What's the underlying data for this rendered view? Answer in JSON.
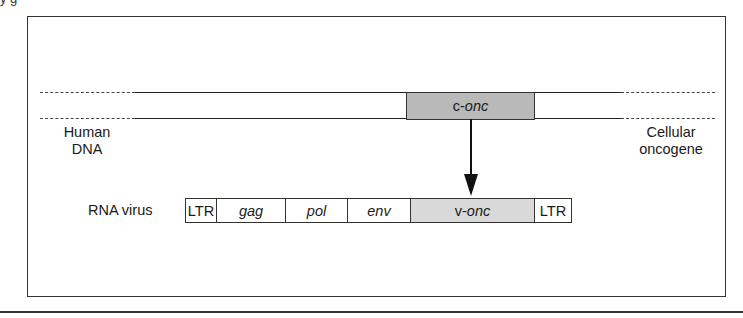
{
  "diagram": {
    "caption_fragment": "y g",
    "dna": {
      "left_label_line1": "Human",
      "left_label_line2": "DNA",
      "right_label_line1": "Cellular",
      "right_label_line2": "oncogene",
      "gene_prefix": "c-",
      "gene_name": "onc"
    },
    "arrow": {
      "direction": "down",
      "meaning": "c-onc transduced into RNA virus as v-onc"
    },
    "virus": {
      "label": "RNA virus",
      "segments": [
        {
          "id": "ltr-left",
          "text": "LTR",
          "italic": false,
          "width": 31,
          "fill": "plain"
        },
        {
          "id": "gag",
          "text": "gag",
          "italic": true,
          "width": 69,
          "fill": "plain"
        },
        {
          "id": "pol",
          "text": "pol",
          "italic": true,
          "width": 62,
          "fill": "plain"
        },
        {
          "id": "env",
          "text": "env",
          "italic": true,
          "width": 63,
          "fill": "plain"
        },
        {
          "id": "v-onc",
          "prefix": "v-",
          "text": "onc",
          "italic": true,
          "width": 124,
          "fill": "shaded"
        },
        {
          "id": "ltr-right",
          "text": "LTR",
          "italic": false,
          "width": 38,
          "fill": "plain"
        }
      ]
    },
    "colors": {
      "line": "#222222",
      "c_onc_fill": "#b9b9b9",
      "v_onc_fill": "#d9d9d9",
      "background": "#ffffff"
    }
  }
}
